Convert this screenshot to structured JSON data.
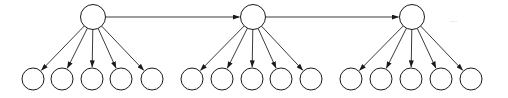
{
  "diagram": {
    "type": "tree-fanout-chain",
    "canvas": {
      "width": 508,
      "height": 98,
      "background": "#ffffff"
    },
    "style": {
      "stroke_color": "#1a1a1a",
      "edge_color": "#3a3a3a",
      "node_fill": "#ffffff",
      "ellipsis_color": "#b8b8b8",
      "stroke_width": 1
    },
    "parent_nodes": [
      {
        "id": "p1",
        "label": "",
        "cx": 93,
        "cy": 17,
        "r": 12.5
      },
      {
        "id": "p2",
        "label": "",
        "cx": 253,
        "cy": 17,
        "r": 12.5
      },
      {
        "id": "p3",
        "label": "",
        "cx": 412,
        "cy": 17,
        "r": 12.5
      }
    ],
    "child_nodes": [
      {
        "id": "c1",
        "parent": "p1",
        "label": "",
        "cx": 33,
        "cy": 79,
        "r": 11
      },
      {
        "id": "c2",
        "parent": "p1",
        "label": "",
        "cx": 62,
        "cy": 79,
        "r": 11
      },
      {
        "id": "c3",
        "parent": "p1",
        "label": "",
        "cx": 92,
        "cy": 79,
        "r": 11
      },
      {
        "id": "c4",
        "parent": "p1",
        "label": "",
        "cx": 121,
        "cy": 79,
        "r": 11
      },
      {
        "id": "c5",
        "parent": "p1",
        "label": "",
        "cx": 152,
        "cy": 79,
        "r": 11
      },
      {
        "id": "c6",
        "parent": "p2",
        "label": "",
        "cx": 192,
        "cy": 79,
        "r": 11
      },
      {
        "id": "c7",
        "parent": "p2",
        "label": "",
        "cx": 222,
        "cy": 79,
        "r": 11
      },
      {
        "id": "c8",
        "parent": "p2",
        "label": "",
        "cx": 252,
        "cy": 79,
        "r": 11
      },
      {
        "id": "c9",
        "parent": "p2",
        "label": "",
        "cx": 281,
        "cy": 79,
        "r": 11
      },
      {
        "id": "c10",
        "parent": "p2",
        "label": "",
        "cx": 311,
        "cy": 79,
        "r": 11
      },
      {
        "id": "c11",
        "parent": "p3",
        "label": "",
        "cx": 351,
        "cy": 79,
        "r": 11
      },
      {
        "id": "c12",
        "parent": "p3",
        "label": "",
        "cx": 381,
        "cy": 79,
        "r": 11
      },
      {
        "id": "c13",
        "parent": "p3",
        "label": "",
        "cx": 411,
        "cy": 79,
        "r": 11
      },
      {
        "id": "c14",
        "parent": "p3",
        "label": "",
        "cx": 441,
        "cy": 79,
        "r": 11
      },
      {
        "id": "c15",
        "parent": "p3",
        "label": "",
        "cx": 471,
        "cy": 79,
        "r": 11
      }
    ],
    "chain_edges": [
      {
        "from": "p1",
        "to": "p2",
        "directed": true
      },
      {
        "from": "p2",
        "to": "p3",
        "directed": true
      }
    ],
    "fanout_edges": [
      {
        "from": "p1",
        "to": "c1",
        "directed": true
      },
      {
        "from": "p1",
        "to": "c2",
        "directed": true
      },
      {
        "from": "p1",
        "to": "c3",
        "directed": true
      },
      {
        "from": "p1",
        "to": "c4",
        "directed": true
      },
      {
        "from": "p1",
        "to": "c5",
        "directed": true
      },
      {
        "from": "p2",
        "to": "c6",
        "directed": true
      },
      {
        "from": "p2",
        "to": "c7",
        "directed": true
      },
      {
        "from": "p2",
        "to": "c8",
        "directed": true
      },
      {
        "from": "p2",
        "to": "c9",
        "directed": true
      },
      {
        "from": "p2",
        "to": "c10",
        "directed": true
      },
      {
        "from": "p3",
        "to": "c11",
        "directed": true
      },
      {
        "from": "p3",
        "to": "c12",
        "directed": true
      },
      {
        "from": "p3",
        "to": "c13",
        "directed": true
      },
      {
        "from": "p3",
        "to": "c14",
        "directed": true
      },
      {
        "from": "p3",
        "to": "c15",
        "directed": true
      }
    ],
    "annotations": [
      {
        "id": "a1",
        "text": "...",
        "x": 450,
        "y": 22
      }
    ]
  }
}
